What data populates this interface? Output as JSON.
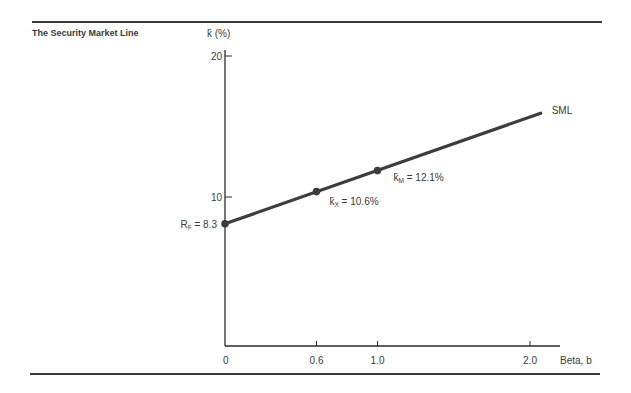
{
  "figure": {
    "title": "The Security Market Line"
  },
  "colors": {
    "line": "#3d3d3d",
    "axis": "#2a2a2a",
    "text": "#3a3a3a"
  },
  "chart_data": {
    "type": "line",
    "title": "The Security Market Line",
    "xlabel": "Beta, b",
    "ylabel": "k̄ (%)",
    "xlim": [
      0,
      2.2
    ],
    "ylim": [
      0,
      20
    ],
    "grid": false,
    "x_ticks": [
      {
        "value": 0,
        "label": "0"
      },
      {
        "value": 0.6,
        "label": "0.6"
      },
      {
        "value": 1.0,
        "label": "1.0"
      },
      {
        "value": 2.0,
        "label": "2.0"
      }
    ],
    "y_ticks": [
      {
        "value": 10,
        "label": "10"
      },
      {
        "value": 20,
        "label": "20"
      }
    ],
    "series": [
      {
        "name": "SML",
        "x": [
          0,
          2.07
        ],
        "y": [
          8.3,
          16.2
        ]
      }
    ],
    "points": [
      {
        "name": "risk-free",
        "x": 0,
        "y": 8.3,
        "label": "R_F = 8.3",
        "label_main": "R",
        "label_sub": "F",
        "label_rest": " = 8.3"
      },
      {
        "name": "security-x",
        "x": 0.6,
        "y": 10.6,
        "label": "k̄_X = 10.6%",
        "label_main": "k̄",
        "label_sub": "X",
        "label_rest": " = 10.6%"
      },
      {
        "name": "market",
        "x": 1.0,
        "y": 12.1,
        "label": "k̄_M = 12.1%",
        "label_main": "k̄",
        "label_sub": "M",
        "label_rest": " = 12.1%"
      }
    ],
    "annotations": [
      {
        "text": "SML",
        "x": 2.07,
        "y": 16.2
      }
    ]
  }
}
